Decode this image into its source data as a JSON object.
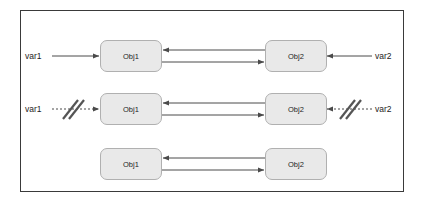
{
  "diagram": {
    "type": "object-reference-diagram",
    "frame": {
      "border_color": "#3a3a3a"
    },
    "box_style": {
      "fill": "#e9e9e9",
      "stroke": "#b0b0b0"
    },
    "line_color": "#4a4a4a",
    "rows": [
      {
        "id": "row-1",
        "state": "both-references-active",
        "left_var": {
          "label": "var1",
          "link": "solid",
          "severed": false
        },
        "right_var": {
          "label": "var2",
          "link": "solid",
          "severed": false
        },
        "left_box": {
          "label": "Obj1"
        },
        "right_box": {
          "label": "Obj2"
        },
        "mutual_links": [
          {
            "direction": "left",
            "from": "Obj2",
            "to": "Obj1"
          },
          {
            "direction": "right",
            "from": "Obj1",
            "to": "Obj2"
          }
        ]
      },
      {
        "id": "row-2",
        "state": "both-references-severed",
        "left_var": {
          "label": "var1",
          "link": "dashed",
          "severed": true
        },
        "right_var": {
          "label": "var2",
          "link": "dashed",
          "severed": true
        },
        "left_box": {
          "label": "Obj1"
        },
        "right_box": {
          "label": "Obj2"
        },
        "mutual_links": [
          {
            "direction": "left",
            "from": "Obj2",
            "to": "Obj1"
          },
          {
            "direction": "right",
            "from": "Obj1",
            "to": "Obj2"
          }
        ]
      },
      {
        "id": "row-3",
        "state": "isolated-cycle",
        "left_var": null,
        "right_var": null,
        "left_box": {
          "label": "Obj1"
        },
        "right_box": {
          "label": "Obj2"
        },
        "mutual_links": [
          {
            "direction": "left",
            "from": "Obj2",
            "to": "Obj1"
          },
          {
            "direction": "right",
            "from": "Obj1",
            "to": "Obj2"
          }
        ]
      }
    ]
  }
}
